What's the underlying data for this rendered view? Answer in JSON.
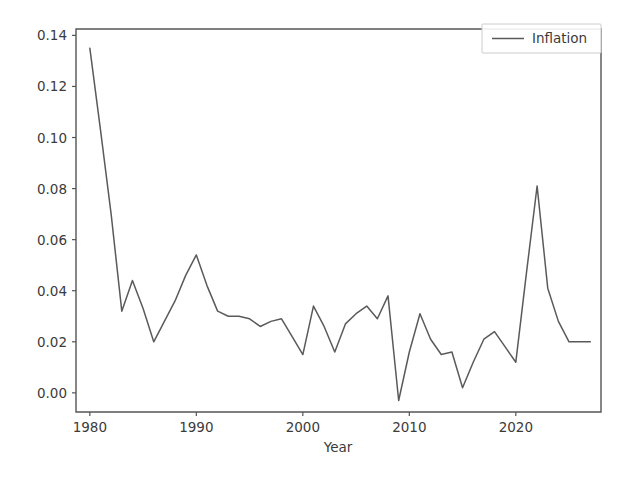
{
  "chart_data": {
    "type": "line",
    "title": "",
    "xlabel": "Year",
    "ylabel": "",
    "xlim": [
      1978.7,
      2028.0
    ],
    "ylim": [
      -0.0075,
      0.1425
    ],
    "grid": false,
    "legend_position": "upper right",
    "xticks": [
      1980,
      1990,
      2000,
      2010,
      2020
    ],
    "xtick_labels": [
      "1980",
      "1990",
      "2000",
      "2010",
      "2020"
    ],
    "yticks": [
      0.0,
      0.02,
      0.04,
      0.06,
      0.08,
      0.1,
      0.12,
      0.14
    ],
    "ytick_labels": [
      "0.00",
      "0.02",
      "0.04",
      "0.06",
      "0.08",
      "0.10",
      "0.12",
      "0.14"
    ],
    "series": [
      {
        "name": "Inflation",
        "color": "#5a5a5a",
        "x": [
          1980,
          1981,
          1982,
          1983,
          1984,
          1985,
          1986,
          1987,
          1988,
          1989,
          1990,
          1991,
          1992,
          1993,
          1994,
          1995,
          1996,
          1997,
          1998,
          1999,
          2000,
          2001,
          2002,
          2003,
          2004,
          2005,
          2006,
          2007,
          2008,
          2009,
          2010,
          2011,
          2012,
          2013,
          2014,
          2015,
          2016,
          2017,
          2018,
          2019,
          2020,
          2021,
          2022,
          2023,
          2024,
          2025,
          2026,
          2027
        ],
        "values": [
          0.135,
          0.103,
          0.07,
          0.032,
          0.044,
          0.033,
          0.02,
          0.028,
          0.036,
          0.046,
          0.054,
          0.042,
          0.032,
          0.03,
          0.03,
          0.029,
          0.026,
          0.028,
          0.029,
          0.022,
          0.015,
          0.034,
          0.026,
          0.016,
          0.027,
          0.031,
          0.034,
          0.029,
          0.038,
          -0.003,
          0.016,
          0.031,
          0.021,
          0.015,
          0.016,
          0.002,
          0.012,
          0.021,
          0.024,
          0.018,
          0.012,
          0.047,
          0.081,
          0.041,
          0.028,
          0.02,
          0.02,
          0.02
        ]
      }
    ]
  },
  "legend": {
    "entries": [
      {
        "label": "Inflation"
      }
    ]
  },
  "axes": {
    "x_title": "Year"
  }
}
